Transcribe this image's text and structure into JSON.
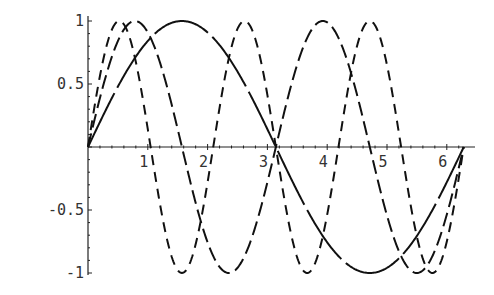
{
  "chart_data": {
    "type": "line",
    "title": "",
    "xlabel": "",
    "ylabel": "",
    "xlim": [
      0,
      6.2832
    ],
    "ylim": [
      -1,
      1
    ],
    "grid": false,
    "legend": null,
    "x_ticks": [
      1,
      2,
      3,
      4,
      5,
      6
    ],
    "x_tick_labels": [
      "1",
      "2",
      "3",
      "4",
      "5",
      "6"
    ],
    "y_ticks": [
      1,
      0.5,
      -0.5,
      -1
    ],
    "y_tick_labels": [
      "1",
      "0.5",
      "-0.5",
      "-1"
    ],
    "series": [
      {
        "name": "sin(x)",
        "frequency": 1,
        "style": "long-dash",
        "dasharray": "60,6",
        "x": [
          0,
          0.785,
          1.571,
          2.356,
          3.142,
          3.927,
          4.712,
          5.498,
          6.283
        ],
        "values": [
          0,
          0.707,
          1,
          0.707,
          0,
          -0.707,
          -1,
          -0.707,
          0
        ]
      },
      {
        "name": "sin(2x)",
        "frequency": 2,
        "style": "dash",
        "dasharray": "14,6",
        "x": [
          0,
          0.785,
          1.571,
          2.356,
          3.142,
          3.927,
          4.712,
          5.498,
          6.283
        ],
        "values": [
          0,
          1,
          0,
          -1,
          0,
          1,
          0,
          -1,
          0
        ]
      },
      {
        "name": "sin(3x)",
        "frequency": 3,
        "style": "dash",
        "dasharray": "10,7",
        "x": [
          0,
          0.524,
          1.047,
          1.571,
          2.094,
          2.618,
          3.142,
          3.665,
          4.189,
          4.712,
          5.236,
          5.76,
          6.283
        ],
        "values": [
          0,
          1,
          0,
          -1,
          0,
          1,
          0,
          -1,
          0,
          1,
          0,
          -1,
          0
        ]
      }
    ]
  }
}
